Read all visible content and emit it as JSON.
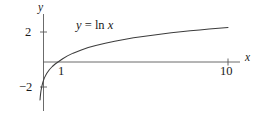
{
  "figure": {
    "name": "natural-logarithm-graph",
    "width": 261,
    "height": 114,
    "background_color": "#ffffff",
    "ink_color": "#3c3c3c",
    "text_color": "#1a1a1a"
  },
  "axes": {
    "x_axis_label": "x",
    "y_axis_label": "y",
    "x_ticks": [
      {
        "value": 1,
        "label": "1"
      },
      {
        "value": 10,
        "label": "10"
      }
    ],
    "y_ticks": [
      {
        "value": 2,
        "label": "2"
      },
      {
        "value": -2,
        "label": "−2"
      }
    ],
    "xlim": [
      -0.35,
      11.6
    ],
    "ylim": [
      -3.35,
      2.9
    ],
    "grid": false
  },
  "annotations": [
    {
      "name": "curve-equation",
      "text": "y = ln x",
      "parts": {
        "lhs": "y",
        "operator": "=",
        "function": "ln",
        "argument": "x"
      }
    }
  ],
  "chart_data": {
    "type": "line",
    "title": "",
    "subtitle": "",
    "xlabel": "x",
    "ylabel": "y",
    "xlim": [
      -0.35,
      11.6
    ],
    "ylim": [
      -3.35,
      2.9
    ],
    "grid": false,
    "legend": "none",
    "xticks": [
      1,
      10
    ],
    "xticklabels": [
      "1",
      "10"
    ],
    "yticks": [
      -2,
      2
    ],
    "yticklabels": [
      "−2",
      "2"
    ],
    "series": [
      {
        "name": "y = ln x",
        "expression": "ln(x)",
        "color": "#3c3c3c",
        "x": [
          0.048,
          0.06,
          0.08,
          0.1,
          0.14,
          0.2,
          0.28,
          0.4,
          0.55,
          0.7,
          0.85,
          1.0,
          1.25,
          1.5,
          1.8,
          2.2,
          2.6,
          3.0,
          3.5,
          4.0,
          4.5,
          5.0,
          5.5,
          6.0,
          6.5,
          7.0,
          7.5,
          8.0,
          8.5,
          9.0,
          9.5,
          10.0
        ],
        "y": [
          -3.04,
          -2.81,
          -2.53,
          -2.3,
          -1.97,
          -1.61,
          -1.27,
          -0.92,
          -0.6,
          -0.36,
          -0.16,
          0.0,
          0.22,
          0.41,
          0.59,
          0.79,
          0.96,
          1.1,
          1.25,
          1.39,
          1.5,
          1.61,
          1.7,
          1.79,
          1.87,
          1.95,
          2.01,
          2.08,
          2.14,
          2.2,
          2.25,
          2.3
        ]
      }
    ],
    "annotations": [
      {
        "text": "y = ln x",
        "x": 2.2,
        "y": 2.55
      }
    ]
  }
}
